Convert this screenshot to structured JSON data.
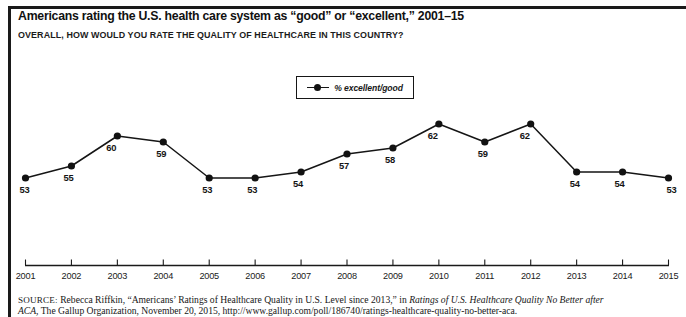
{
  "title": "Americans rating the U.S. health care system as “good” or “excellent,” 2001–15",
  "subtitle": "OVERALL, HOW WOULD YOU RATE THE QUALITY OF HEALTHCARE IN THIS COUNTRY?",
  "legend": {
    "label": "% excellent/good",
    "marker": "line-with-dot-marker"
  },
  "source": {
    "prefix": "SOURCE:",
    "line1_a": " Rebecca Riffkin, “Americans’ Ratings of Healthcare Quality in U.S. Level since 2013,” in ",
    "line1_italic": "Ratings of U.S. Healthcare Quality No Better after",
    "line2_italic": "ACA,",
    "line2_b": " The Gallup Organization, November 20, 2015, http://www.gallup.com/poll/186740/ratings-healthcare-quality-no-better-aca."
  },
  "chart_data": {
    "type": "line",
    "title": "Americans rating the U.S. health care system as “good” or “excellent,” 2001–15",
    "subtitle": "OVERALL, HOW WOULD YOU RATE THE QUALITY OF HEALTHCARE IN THIS COUNTRY?",
    "xlabel": "",
    "ylabel": "",
    "categories": [
      "2001",
      "2002",
      "2003",
      "2004",
      "2005",
      "2006",
      "2007",
      "2008",
      "2009",
      "2010",
      "2011",
      "2012",
      "2013",
      "2014",
      "2015"
    ],
    "series": [
      {
        "name": "% excellent/good",
        "values": [
          53,
          55,
          60,
          59,
          53,
          53,
          54,
          57,
          58,
          62,
          59,
          62,
          54,
          54,
          53
        ],
        "color": "#121212",
        "marker": "circle",
        "show_data_labels": true
      }
    ],
    "ylim": [
      50,
      64
    ],
    "y_axis_visible": false,
    "grid": false,
    "legend_position": "top-center",
    "axis_color": "#1a1a1a",
    "line_color": "#151515"
  }
}
